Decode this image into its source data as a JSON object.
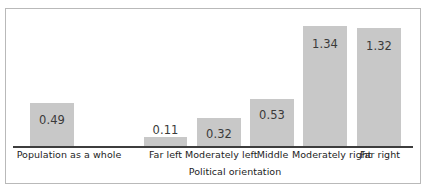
{
  "chart_data": {
    "type": "bar",
    "title": "",
    "subtitle": "",
    "xlabel": "Political orientation",
    "ylabel": "",
    "ylim": [
      0,
      1.5
    ],
    "grid": false,
    "legend": null,
    "bar_color": "#c8c8c8",
    "axis_color": "#3d3d3d",
    "label_color": "#3a3a3a",
    "categories": [
      "Population as a whole",
      "Far left",
      "Moderately left",
      "Middle",
      "Moderately right",
      "Far right"
    ],
    "values": [
      0.49,
      0.11,
      0.32,
      0.53,
      1.34,
      1.32
    ],
    "value_labels": [
      "0.49",
      "0.11",
      "0.32",
      "0.53",
      "1.34",
      "1.32"
    ],
    "note": "first bar is visually separated from the political-orientation group"
  },
  "bars": [
    {
      "label": "Population as a whole",
      "value_label": "0.49",
      "value": 0.49,
      "left": 30,
      "width": 44,
      "height": 44,
      "label_left": 14,
      "label_width": 110,
      "value_top": 10
    },
    {
      "label": "Far left",
      "value_label": "0.11",
      "value": 0.11,
      "left": 144,
      "width": 43,
      "height": 10,
      "label_left": 143,
      "label_width": 45,
      "value_top": -14
    },
    {
      "label": "Moderately left",
      "value_label": "0.32",
      "value": 0.32,
      "left": 197,
      "width": 44,
      "height": 29,
      "label_left": 185,
      "label_width": 68,
      "value_top": 9
    },
    {
      "label": "Middle",
      "value_label": "0.53",
      "value": 0.53,
      "left": 250,
      "width": 44,
      "height": 48,
      "label_left": 250,
      "label_width": 45,
      "value_top": 9
    },
    {
      "label": "Moderately right",
      "value_label": "1.34",
      "value": 1.34,
      "left": 303,
      "width": 44,
      "height": 121,
      "label_left": 292,
      "label_width": 70,
      "value_top": 11
    },
    {
      "label": "Far right",
      "value_label": "1.32",
      "value": 1.32,
      "left": 357,
      "width": 44,
      "height": 119,
      "label_left": 356,
      "label_width": 48,
      "value_top": 11
    }
  ],
  "axis": {
    "x_title": "Political orientation"
  }
}
